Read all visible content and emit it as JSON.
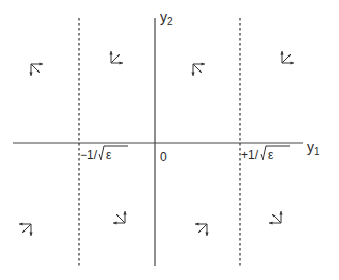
{
  "diagram": {
    "axes": {
      "horizontal": {
        "label_main": "y",
        "label_sub": "1"
      },
      "vertical": {
        "label_main": "y",
        "label_sub": "2"
      },
      "origin_label": "0"
    },
    "boundaries": [
      {
        "name": "neg",
        "label_sign": "−",
        "label_text": "1/",
        "label_radicand": "ε",
        "y1_value": "-1/sqrt(epsilon)"
      },
      {
        "name": "pos",
        "label_sign": "+",
        "label_text": "1/",
        "label_radicand": "ε",
        "y1_value": "+1/sqrt(epsilon)"
      }
    ],
    "glyphs": [
      {
        "region": "far-left-upper",
        "corner": "top-left",
        "arrows": [
          "right",
          "down",
          "down-right"
        ]
      },
      {
        "region": "mid-left-upper",
        "corner": "bottom-left",
        "arrows": [
          "up",
          "right",
          "up-right"
        ]
      },
      {
        "region": "mid-right-upper",
        "corner": "top-left",
        "arrows": [
          "right",
          "down",
          "down-right"
        ]
      },
      {
        "region": "far-right-upper",
        "corner": "bottom-left",
        "arrows": [
          "up",
          "right",
          "up-right"
        ]
      },
      {
        "region": "far-left-lower",
        "corner": "top-right",
        "arrows": [
          "left",
          "down",
          "down-left"
        ]
      },
      {
        "region": "mid-left-lower",
        "corner": "bottom-right",
        "arrows": [
          "up",
          "left",
          "up-left"
        ]
      },
      {
        "region": "mid-right-lower",
        "corner": "top-right",
        "arrows": [
          "left",
          "down",
          "down-left"
        ]
      },
      {
        "region": "far-right-lower",
        "corner": "bottom-right",
        "arrows": [
          "up",
          "left",
          "up-left"
        ]
      }
    ]
  }
}
